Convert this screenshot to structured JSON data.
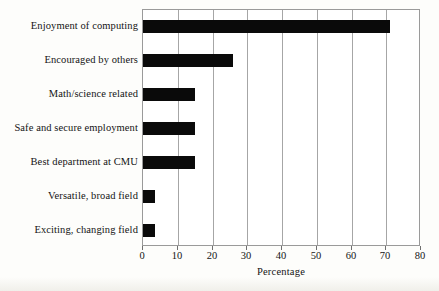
{
  "chart_data": {
    "type": "bar",
    "orientation": "horizontal",
    "title": "",
    "subtitle": "",
    "xlabel": "Percentage",
    "ylabel": "",
    "categories": [
      "Enjoyment of computing",
      "Encouraged by others",
      "Math/science related",
      "Safe and secure employment",
      "Best department at CMU",
      "Versatile, broad field",
      "Exciting, changing field"
    ],
    "values": [
      71,
      26,
      15,
      15,
      15,
      3.5,
      3.5
    ],
    "xlim": [
      0,
      80
    ],
    "xticks": [
      0,
      10,
      20,
      30,
      40,
      50,
      60,
      70,
      80
    ],
    "xtick_labels": [
      "0",
      "10",
      "20",
      "30",
      "40",
      "50",
      "60",
      "70",
      "80"
    ],
    "grid": true,
    "grid_axis": "x",
    "legend": false,
    "bar_color": "#0a0a0a",
    "frame_color": "#9a9a9a",
    "grid_color": "#a6a6a6",
    "background_color": "#ffffff"
  }
}
